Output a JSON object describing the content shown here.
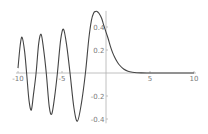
{
  "chart_data": {
    "type": "line",
    "title": "",
    "xlabel": "",
    "ylabel": "",
    "function": "AiryAi(x)",
    "xlim": [
      -10,
      10
    ],
    "ylim": [
      -0.42,
      0.54
    ],
    "grid": false,
    "legend": null,
    "x_ticks": [
      -10,
      -5,
      5,
      10
    ],
    "x_tick_labels": [
      "-10",
      "-5",
      "5",
      "10"
    ],
    "y_ticks": [
      -0.4,
      -0.2,
      0.2,
      0.4
    ],
    "y_tick_labels": [
      "-0.4",
      "-0.2",
      "0.2",
      "0.4"
    ],
    "series": [
      {
        "name": "Ai(x)",
        "color": "#444444",
        "x": [
          -10,
          -9.75,
          -9.535,
          -9.25,
          -9.022,
          -8.75,
          -8.488,
          -8.25,
          -7.944,
          -7.65,
          -7.372,
          -7.1,
          -6.787,
          -6.45,
          -6.163,
          -5.85,
          -5.521,
          -5.15,
          -4.82,
          -4.45,
          -4.088,
          -3.65,
          -3.248,
          -2.8,
          -2.338,
          -1.95,
          -1.65,
          -1.4,
          -1.2,
          -1.019,
          -0.8,
          -0.5,
          -0.25,
          0,
          0.25,
          0.5,
          0.75,
          1,
          1.25,
          1.5,
          2,
          2.5,
          3,
          3.5,
          4,
          5,
          6,
          7,
          8,
          9,
          10
        ],
        "y": [
          0.0424,
          0.241,
          0.3112,
          0.188,
          0.0,
          -0.238,
          -0.3221,
          -0.192,
          0.0,
          0.256,
          0.3368,
          0.212,
          0.0,
          -0.293,
          -0.3562,
          -0.214,
          0.0,
          0.29,
          0.38,
          0.23,
          0.0,
          -0.3,
          -0.419,
          -0.266,
          0.0,
          0.3,
          0.46,
          0.522,
          0.535,
          0.5357,
          0.519,
          0.4757,
          0.4139,
          0.355,
          0.298,
          0.2317,
          0.1776,
          0.1353,
          0.0996,
          0.0717,
          0.0349,
          0.0157,
          0.0066,
          0.0025,
          0.001,
          0.0001,
          0.0,
          0.0,
          0.0,
          0.0,
          0.0
        ]
      }
    ]
  },
  "colors": {
    "curve": "#444444",
    "axis": "#b0b0b0",
    "label": "#7a7a7a"
  }
}
